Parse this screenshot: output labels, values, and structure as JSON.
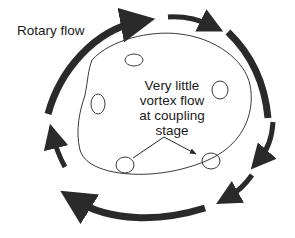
{
  "diagram": {
    "title_label": "Rotary flow",
    "center_label_lines": [
      "Very little",
      "vortex flow",
      "at coupling",
      "stage"
    ],
    "colors": {
      "arrow": "#2a2a2a",
      "line": "#3a3a3a",
      "background": "#ffffff"
    },
    "elements": {
      "outer_rotary_arrows": 7,
      "inner_flow_path": 1,
      "small_vortex_loops": 5,
      "pointer_lines": 2
    }
  }
}
